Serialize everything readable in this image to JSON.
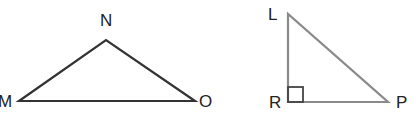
{
  "figure": {
    "triangles": [
      {
        "name": "MNO",
        "vertices": [
          "M",
          "N",
          "O"
        ],
        "right_angle_at": null,
        "labels": {
          "M": "M",
          "N": "N",
          "O": "O"
        }
      },
      {
        "name": "LRP",
        "vertices": [
          "L",
          "R",
          "P"
        ],
        "right_angle_at": "R",
        "labels": {
          "L": "L",
          "R": "R",
          "P": "P"
        }
      }
    ],
    "colors": {
      "triangle_mno_stroke": "#333333",
      "triangle_lrp_stroke": "#8a8a8a",
      "label": "#222222"
    }
  }
}
